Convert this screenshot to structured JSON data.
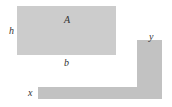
{
  "diagram": {
    "rectangle": {
      "area_label": "A",
      "height_label": "h",
      "width_label": "b",
      "fill": "#cccccc"
    },
    "l_shape": {
      "horizontal_label": "x",
      "vertical_label": "y",
      "fill": "#c2c2c2"
    }
  }
}
